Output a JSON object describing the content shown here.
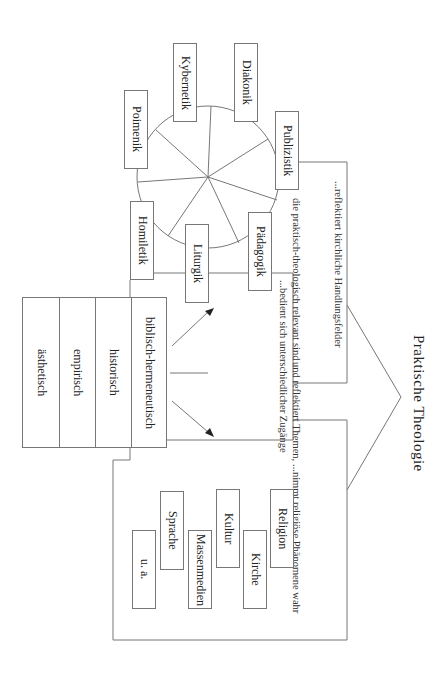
{
  "title": "Praktische Theologie",
  "wheel": {
    "fields": [
      {
        "id": "diakonik",
        "label": "Diakonik"
      },
      {
        "id": "kybernetik",
        "label": "Kybernetik"
      },
      {
        "id": "poimenik",
        "label": "Poimenik"
      },
      {
        "id": "publizistik",
        "label": "Publizistik"
      },
      {
        "id": "paedagogik",
        "label": "Pädagogik"
      },
      {
        "id": "homiletik",
        "label": "Homiletik"
      },
      {
        "id": "liturgik",
        "label": "Liturgik"
      }
    ]
  },
  "branches": {
    "reflektiert": "...reflektiert kirchliche Handlungsfelder",
    "bedient": "...bedient sich unterschiedlicher Zugänge",
    "nimmt_lines": [
      "...nimmt religiöse Phänomene wahr",
      "und reflektiert Themen,",
      "die praktisch-theologisch relevant sind"
    ]
  },
  "methods": [
    "biblisch-hermeneutisch",
    "historisch",
    "empirisch",
    "ästhetisch"
  ],
  "themes": [
    {
      "id": "religion",
      "label": "Religion"
    },
    {
      "id": "kirche",
      "label": "Kirche"
    },
    {
      "id": "kultur",
      "label": "Kultur"
    },
    {
      "id": "massenmedien",
      "label": "Massenmedien"
    },
    {
      "id": "sprache",
      "label": "Sprache"
    },
    {
      "id": "ua",
      "label": "u. a."
    }
  ],
  "colors": {
    "line": "#777777",
    "text": "#222222",
    "background": "#ffffff"
  }
}
